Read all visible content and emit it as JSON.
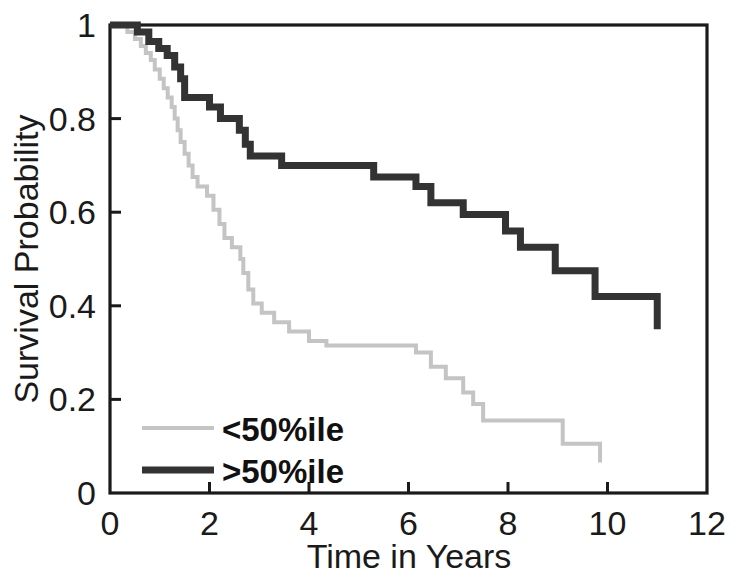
{
  "chart_data": {
    "type": "line",
    "subtype": "kaplan-meier-step",
    "title": "",
    "xlabel": "Time in Years",
    "ylabel": "Survival Probability",
    "xlim": [
      0,
      12
    ],
    "ylim": [
      0,
      1
    ],
    "xticks": [
      0,
      2,
      4,
      6,
      8,
      10,
      12
    ],
    "xtick_labels": [
      "0",
      "2",
      "4",
      "6",
      "8",
      "10",
      "12"
    ],
    "yticks": [
      0,
      0.2,
      0.4,
      0.6,
      0.8,
      1
    ],
    "ytick_labels": [
      "0",
      "0.2",
      "0.4",
      "0.6",
      "0.8",
      "1"
    ],
    "grid": false,
    "legend_position": "lower-left",
    "series": [
      {
        "name": "<50%ile",
        "color": "#c4c4c4",
        "linewidth": 4,
        "points": [
          [
            0.0,
            1.0
          ],
          [
            0.35,
            1.0
          ],
          [
            0.35,
            0.985
          ],
          [
            0.5,
            0.985
          ],
          [
            0.5,
            0.97
          ],
          [
            0.62,
            0.97
          ],
          [
            0.62,
            0.955
          ],
          [
            0.72,
            0.955
          ],
          [
            0.72,
            0.94
          ],
          [
            0.82,
            0.94
          ],
          [
            0.82,
            0.925
          ],
          [
            0.9,
            0.925
          ],
          [
            0.9,
            0.905
          ],
          [
            1.0,
            0.905
          ],
          [
            1.0,
            0.885
          ],
          [
            1.08,
            0.885
          ],
          [
            1.08,
            0.865
          ],
          [
            1.16,
            0.865
          ],
          [
            1.16,
            0.845
          ],
          [
            1.24,
            0.845
          ],
          [
            1.24,
            0.825
          ],
          [
            1.3,
            0.825
          ],
          [
            1.3,
            0.8
          ],
          [
            1.36,
            0.8
          ],
          [
            1.36,
            0.775
          ],
          [
            1.42,
            0.775
          ],
          [
            1.42,
            0.75
          ],
          [
            1.5,
            0.75
          ],
          [
            1.5,
            0.725
          ],
          [
            1.58,
            0.725
          ],
          [
            1.58,
            0.7
          ],
          [
            1.66,
            0.7
          ],
          [
            1.66,
            0.675
          ],
          [
            1.76,
            0.675
          ],
          [
            1.76,
            0.655
          ],
          [
            1.95,
            0.655
          ],
          [
            1.95,
            0.635
          ],
          [
            2.08,
            0.635
          ],
          [
            2.08,
            0.605
          ],
          [
            2.2,
            0.605
          ],
          [
            2.2,
            0.575
          ],
          [
            2.3,
            0.575
          ],
          [
            2.3,
            0.545
          ],
          [
            2.45,
            0.545
          ],
          [
            2.45,
            0.525
          ],
          [
            2.62,
            0.525
          ],
          [
            2.62,
            0.5
          ],
          [
            2.68,
            0.5
          ],
          [
            2.68,
            0.47
          ],
          [
            2.78,
            0.47
          ],
          [
            2.78,
            0.435
          ],
          [
            2.88,
            0.435
          ],
          [
            2.88,
            0.405
          ],
          [
            3.05,
            0.405
          ],
          [
            3.05,
            0.385
          ],
          [
            3.3,
            0.385
          ],
          [
            3.3,
            0.365
          ],
          [
            3.6,
            0.365
          ],
          [
            3.6,
            0.345
          ],
          [
            4.0,
            0.345
          ],
          [
            4.0,
            0.325
          ],
          [
            4.35,
            0.325
          ],
          [
            4.35,
            0.315
          ],
          [
            6.15,
            0.315
          ],
          [
            6.15,
            0.3
          ],
          [
            6.45,
            0.3
          ],
          [
            6.45,
            0.27
          ],
          [
            6.75,
            0.27
          ],
          [
            6.75,
            0.245
          ],
          [
            7.1,
            0.245
          ],
          [
            7.1,
            0.215
          ],
          [
            7.3,
            0.215
          ],
          [
            7.3,
            0.19
          ],
          [
            7.5,
            0.19
          ],
          [
            7.5,
            0.155
          ],
          [
            9.1,
            0.155
          ],
          [
            9.1,
            0.105
          ],
          [
            9.85,
            0.105
          ],
          [
            9.85,
            0.065
          ]
        ]
      },
      {
        "name": ">50%ile",
        "color": "#333333",
        "linewidth": 7,
        "points": [
          [
            0.0,
            1.0
          ],
          [
            0.55,
            1.0
          ],
          [
            0.55,
            0.985
          ],
          [
            0.78,
            0.985
          ],
          [
            0.78,
            0.965
          ],
          [
            0.98,
            0.965
          ],
          [
            0.98,
            0.95
          ],
          [
            1.15,
            0.95
          ],
          [
            1.15,
            0.935
          ],
          [
            1.3,
            0.935
          ],
          [
            1.3,
            0.91
          ],
          [
            1.42,
            0.91
          ],
          [
            1.42,
            0.885
          ],
          [
            1.5,
            0.885
          ],
          [
            1.5,
            0.845
          ],
          [
            2.0,
            0.845
          ],
          [
            2.0,
            0.825
          ],
          [
            2.22,
            0.825
          ],
          [
            2.22,
            0.8
          ],
          [
            2.6,
            0.8
          ],
          [
            2.6,
            0.775
          ],
          [
            2.72,
            0.775
          ],
          [
            2.72,
            0.745
          ],
          [
            2.82,
            0.745
          ],
          [
            2.82,
            0.72
          ],
          [
            3.45,
            0.72
          ],
          [
            3.45,
            0.7
          ],
          [
            5.3,
            0.7
          ],
          [
            5.3,
            0.675
          ],
          [
            6.15,
            0.675
          ],
          [
            6.15,
            0.655
          ],
          [
            6.45,
            0.655
          ],
          [
            6.45,
            0.62
          ],
          [
            7.1,
            0.62
          ],
          [
            7.1,
            0.595
          ],
          [
            7.95,
            0.595
          ],
          [
            7.95,
            0.56
          ],
          [
            8.25,
            0.56
          ],
          [
            8.25,
            0.525
          ],
          [
            8.95,
            0.525
          ],
          [
            8.95,
            0.475
          ],
          [
            9.75,
            0.475
          ],
          [
            9.75,
            0.42
          ],
          [
            11.0,
            0.42
          ],
          [
            11.0,
            0.35
          ]
        ]
      }
    ],
    "legend": [
      {
        "label": "<50%ile",
        "color": "#c4c4c4",
        "linewidth": 4
      },
      {
        "label": ">50%ile",
        "color": "#333333",
        "linewidth": 7
      }
    ],
    "axis_color": "#1a1a1a"
  }
}
